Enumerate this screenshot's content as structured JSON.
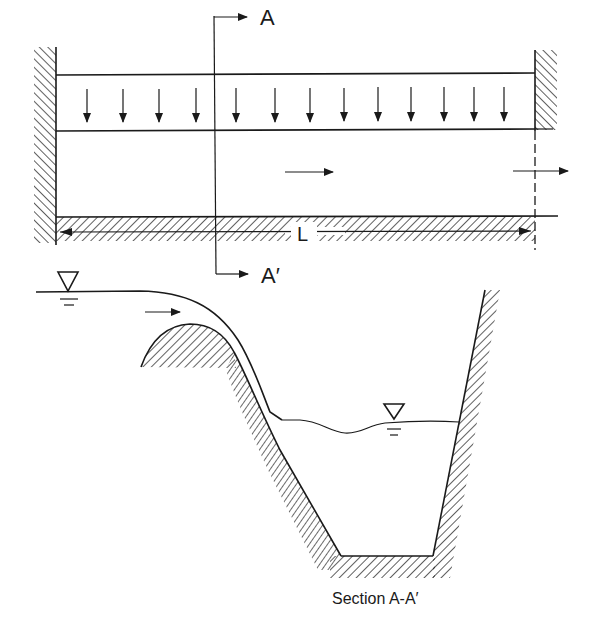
{
  "figure": {
    "type": "engineering schematic",
    "plan_view": {
      "section_label_top": "A",
      "section_label_bottom": "A′",
      "length_label": "L",
      "downward_inflow_arrow_count": 14,
      "flow_direction": "left-to-right"
    },
    "section_view": {
      "caption": "Section A-A′",
      "upstream_water_surface_symbol": "▽",
      "downstream_water_surface_symbol": "▽",
      "flow_direction": "left-to-right"
    },
    "colors": {
      "ink": "#1a1a1a",
      "background": "#ffffff"
    }
  }
}
